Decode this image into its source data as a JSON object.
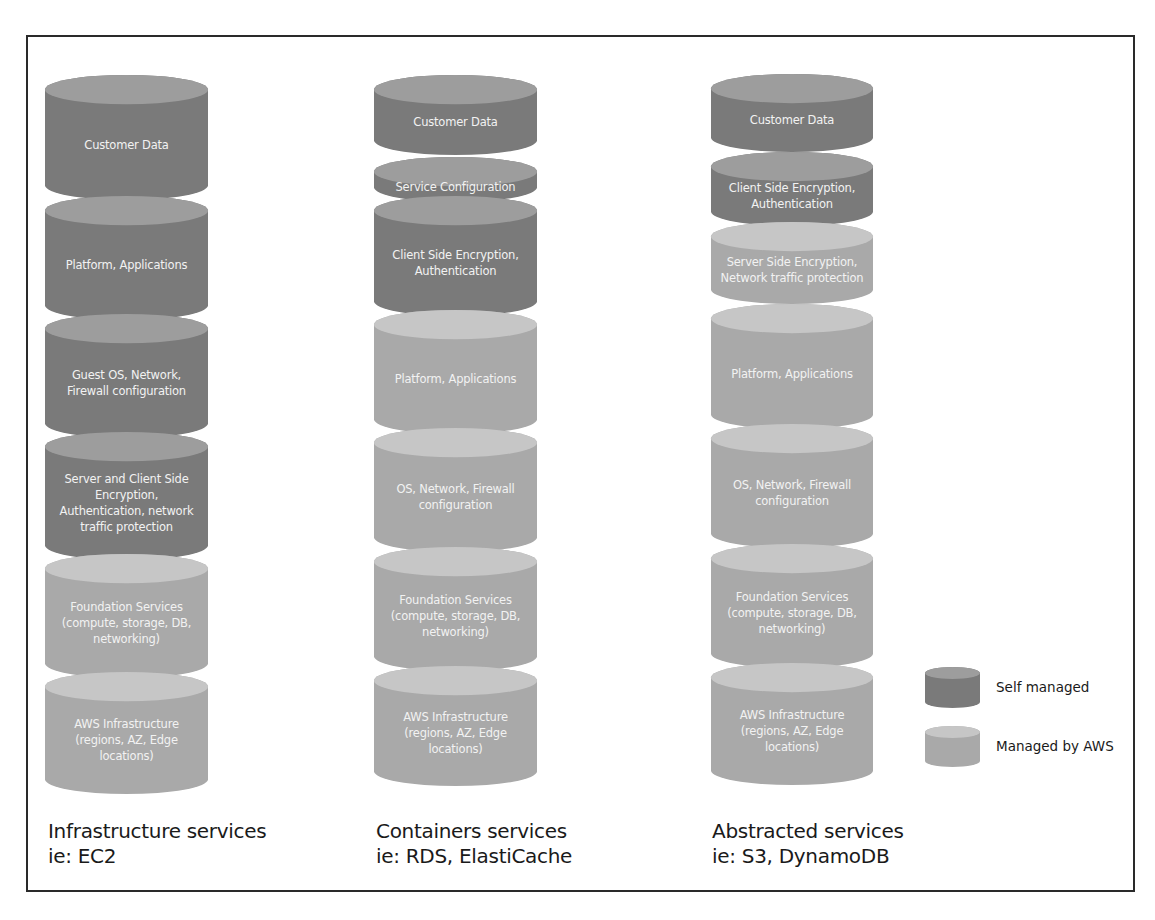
{
  "diagram": {
    "colors": {
      "self_managed_body": "#7a7a7a",
      "self_managed_top": "#9d9d9d",
      "aws_managed_body": "#a9a9a9",
      "aws_managed_top": "#c6c6c6",
      "label_text": "#f2f2f2",
      "frame_border": "#2a2a2a"
    },
    "columns": [
      {
        "caption_title": "Infrastructure services",
        "caption_example": "ie: EC2",
        "layers": [
          {
            "label": "Customer Data",
            "managed": "self"
          },
          {
            "label": "Platform, Applications",
            "managed": "self"
          },
          {
            "label": "Guest OS, Network,\nFirewall configuration",
            "managed": "self"
          },
          {
            "label": "Server and Client Side\nEncryption,\nAuthentication, network\ntraffic protection",
            "managed": "self"
          },
          {
            "label": "Foundation Services\n(compute, storage, DB,\nnetworking)",
            "managed": "aws"
          },
          {
            "label": "AWS Infrastructure\n(regions, AZ, Edge\nlocations)",
            "managed": "aws"
          }
        ]
      },
      {
        "caption_title": "Containers services",
        "caption_example": "ie: RDS, ElastiCache",
        "layers": [
          {
            "label": "Customer Data",
            "managed": "self"
          },
          {
            "label": "Service Configuration",
            "managed": "self"
          },
          {
            "label": "Client Side Encryption,\nAuthentication",
            "managed": "self"
          },
          {
            "label": "Platform, Applications",
            "managed": "aws"
          },
          {
            "label": "OS, Network, Firewall\nconfiguration",
            "managed": "aws"
          },
          {
            "label": "Foundation Services\n(compute, storage, DB,\nnetworking)",
            "managed": "aws"
          },
          {
            "label": "AWS Infrastructure\n(regions, AZ, Edge\nlocations)",
            "managed": "aws"
          }
        ]
      },
      {
        "caption_title": "Abstracted services",
        "caption_example": "ie: S3, DynamoDB",
        "layers": [
          {
            "label": "Customer Data",
            "managed": "self"
          },
          {
            "label": "Client Side Encryption,\nAuthentication",
            "managed": "self"
          },
          {
            "label": "Server Side Encryption,\nNetwork traffic protection",
            "managed": "aws"
          },
          {
            "label": "Platform, Applications",
            "managed": "aws"
          },
          {
            "label": "OS, Network, Firewall\nconfiguration",
            "managed": "aws"
          },
          {
            "label": "Foundation Services\n(compute, storage, DB,\nnetworking)",
            "managed": "aws"
          },
          {
            "label": "AWS Infrastructure\n(regions, AZ, Edge\nlocations)",
            "managed": "aws"
          }
        ]
      }
    ],
    "legend": [
      {
        "label": "Self managed",
        "managed": "self"
      },
      {
        "label": "Managed by AWS",
        "managed": "aws"
      }
    ]
  }
}
